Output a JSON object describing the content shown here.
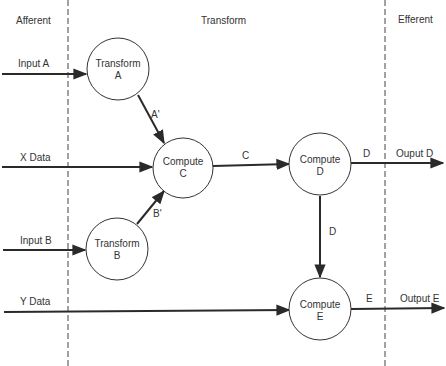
{
  "regions": {
    "afferent": "Afferent",
    "transform": "Transform",
    "efferent": "Efferent"
  },
  "inputs": {
    "input_a": "Input A",
    "x_data": "X Data",
    "input_b": "Input B",
    "y_data": "Y Data"
  },
  "processes": {
    "transform_a": {
      "line1": "Transform",
      "line2": "A"
    },
    "compute_c": {
      "line1": "Compute",
      "line2": "C"
    },
    "transform_b": {
      "line1": "Transform",
      "line2": "B"
    },
    "compute_d": {
      "line1": "Compute",
      "line2": "D"
    },
    "compute_e": {
      "line1": "Compute",
      "line2": "E"
    }
  },
  "flows": {
    "a_prime": "A'",
    "b_prime": "B'",
    "c": "C",
    "d_out": "D",
    "d_down": "D",
    "e": "E"
  },
  "outputs": {
    "output_d": "Ouput D",
    "output_e": "Output E"
  }
}
